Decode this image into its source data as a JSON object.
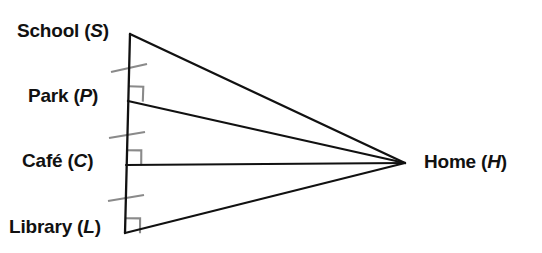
{
  "diagram": {
    "background_color": "#ffffff",
    "line_color": "#111111",
    "mark_color": "#8a8a8a",
    "vertices": {
      "school": {
        "label_prefix": "School (",
        "label_var": "S",
        "label_suffix": ")",
        "x": 130,
        "y": 34
      },
      "park": {
        "label_prefix": "Park (",
        "label_var": "P",
        "label_suffix": ")",
        "x": 128,
        "y": 101
      },
      "cafe": {
        "label_prefix": "Café (",
        "label_var": "C",
        "label_suffix": ")",
        "x": 126,
        "y": 165
      },
      "library": {
        "label_prefix": "Library (",
        "label_var": "L",
        "label_suffix": ")",
        "x": 125,
        "y": 233
      },
      "home": {
        "label_prefix": "Home (",
        "label_var": "H",
        "label_suffix": ")",
        "x": 405,
        "y": 163
      }
    },
    "segments": [
      {
        "name": "transversal-school-library",
        "from": "school",
        "to": "library",
        "stroke_width": 2.2
      },
      {
        "name": "ray-school-home",
        "from": "school",
        "to": "home",
        "stroke_width": 2.2
      },
      {
        "name": "ray-park-home",
        "from": "park",
        "to": "home",
        "stroke_width": 2.2
      },
      {
        "name": "ray-cafe-home",
        "from": "cafe",
        "to": "home",
        "stroke_width": 2.2
      },
      {
        "name": "ray-library-home",
        "from": "library",
        "to": "home",
        "stroke_width": 2.2
      }
    ],
    "tick_marks": [
      {
        "name": "tick-school-park",
        "x": 129,
        "y": 68,
        "note": "congruence tick between School and Park"
      },
      {
        "name": "tick-park-cafe",
        "x": 127,
        "y": 135,
        "note": "congruence tick between Park and Café"
      },
      {
        "name": "tick-cafe-library",
        "x": 126,
        "y": 198,
        "note": "congruence tick between Café and Library"
      }
    ],
    "right_angles": [
      {
        "name": "right-angle-park",
        "vertex": "park",
        "x": 128,
        "y": 101,
        "size": 15
      },
      {
        "name": "right-angle-cafe",
        "vertex": "cafe",
        "x": 126,
        "y": 165,
        "size": 15
      },
      {
        "name": "right-angle-library",
        "vertex": "library",
        "x": 125,
        "y": 233,
        "size": 15
      }
    ]
  }
}
